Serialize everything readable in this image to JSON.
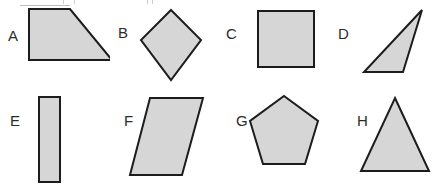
{
  "canvas": {
    "width": 438,
    "height": 186,
    "background_color": "#ffffff",
    "description": "Worksheet page of eight labeled geometric figures arranged in two rows of four"
  },
  "style": {
    "shape_fill_color": "#d6d6d6",
    "shape_outline_color": "#1c1c1c",
    "label_text_color": "#2b2b2b",
    "outline_width_px": 2,
    "label_font_size_px": 15
  },
  "artifacts": {
    "top_crop_marks_color": "#cfcfcf",
    "top_crop_bar_color": "#bdbdbd",
    "note": "faint remnants of figures cropped off above the top edge"
  },
  "rows": [
    {
      "row_name": "top-row",
      "y_offset": 0,
      "shapes": [
        {
          "id": "A",
          "label": "A",
          "shape_name": "right-trapezoid",
          "label_x": 8,
          "label_y": 28,
          "cell_x": 0,
          "cell_y": 0,
          "points": "29,9 70,9 112,60 29,60"
        },
        {
          "id": "B",
          "label": "B",
          "shape_name": "rhombus",
          "label_x": 118,
          "label_y": 25,
          "cell_x": 110,
          "cell_y": 0,
          "points": "61,10 91,40 61,80 31,40"
        },
        {
          "id": "C",
          "label": "C",
          "shape_name": "square",
          "label_x": 226,
          "label_y": 26,
          "cell_x": 219,
          "cell_y": 0,
          "points": "39,11 95,11 95,67 39,67"
        },
        {
          "id": "D",
          "label": "D",
          "shape_name": "scalene-triangle",
          "label_x": 338,
          "label_y": 26,
          "cell_x": 329,
          "cell_y": 0,
          "points": "93,10 74,72 35,72"
        }
      ]
    },
    {
      "row_name": "bottom-row",
      "y_offset": 93,
      "shapes": [
        {
          "id": "E",
          "label": "E",
          "shape_name": "narrow-rectangle",
          "label_x": 10,
          "label_y": 113,
          "cell_x": 0,
          "cell_y": 93,
          "points": "39,4 60,4 60,89 39,89"
        },
        {
          "id": "F",
          "label": "F",
          "shape_name": "parallelogram",
          "label_x": 124,
          "label_y": 113,
          "cell_x": 110,
          "cell_y": 93,
          "points": "40,5 93,5 72,82 20,82"
        },
        {
          "id": "G",
          "label": "G",
          "shape_name": "pentagon",
          "label_x": 236,
          "label_y": 113,
          "cell_x": 219,
          "cell_y": 93,
          "points": "65,3 99,28 86,71 44,71 31,28"
        },
        {
          "id": "H",
          "label": "H",
          "shape_name": "isosceles-triangle",
          "label_x": 357,
          "label_y": 113,
          "cell_x": 329,
          "cell_y": 93,
          "points": "66,5 100,78 32,78"
        }
      ]
    }
  ],
  "top_crop_marks": [
    {
      "x": 63,
      "width": 1
    },
    {
      "x": 74,
      "width": 1
    },
    {
      "x": 147,
      "width": 1
    },
    {
      "x": 152,
      "width": 1
    }
  ],
  "top_crop_bars": [
    {
      "x": 20,
      "width": 50
    }
  ]
}
